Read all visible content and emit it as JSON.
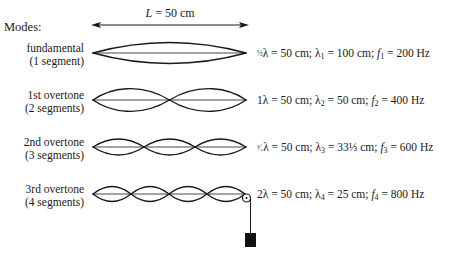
{
  "header": {
    "modes_label": "Modes:",
    "length_var": "L",
    "length_value": " = 50 cm"
  },
  "modes": [
    {
      "name": "fundamental",
      "segments_label": "(1 segment)",
      "segments": 1,
      "coef": "½",
      "eq_a": "λ = 50 cm;  λ",
      "sub_lambda": "1",
      "eq_b": " = 100 cm;  ",
      "f": "f",
      "sub_f": "1",
      "eq_c": " = 200 Hz"
    },
    {
      "name": "1st overtone",
      "segments_label": "(2 segments)",
      "segments": 2,
      "coef": "1",
      "eq_a": "λ = 50 cm;  λ",
      "sub_lambda": "2",
      "eq_b": " = 50 cm;  ",
      "f": "f",
      "sub_f": "2",
      "eq_c": " = 400 Hz"
    },
    {
      "name": "2nd overtone",
      "segments_label": "(3 segments)",
      "segments": 3,
      "coef": "³⁄₂",
      "eq_a": "λ = 50 cm;  λ",
      "sub_lambda": "3",
      "eq_b": " = 33⅓ cm;  ",
      "f": "f",
      "sub_f": "3",
      "eq_c": " = 600 Hz"
    },
    {
      "name": "3rd overtone",
      "segments_label": "(4 segments)",
      "segments": 4,
      "coef": "2",
      "eq_a": "λ = 50 cm;  λ",
      "sub_lambda": "4",
      "eq_b": " = 25 cm;  ",
      "f": "f",
      "sub_f": "4",
      "eq_c": " = 800 Hz"
    }
  ],
  "colors": {
    "ink": "#1a1a1a",
    "background": "#ffffff"
  }
}
